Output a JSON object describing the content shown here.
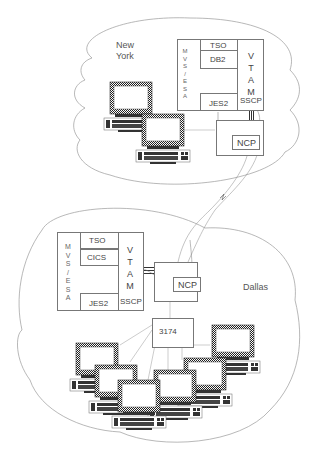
{
  "diagram": {
    "type": "network-topology",
    "sites": [
      {
        "name": "New York",
        "name_lines": [
          "New",
          "York"
        ],
        "host": {
          "os_label_vertical": [
            "M",
            "V",
            "S",
            "/",
            "E",
            "S",
            "A"
          ],
          "subsystems": [
            "TSO",
            "DB2",
            "JES2"
          ],
          "access_method_vertical": [
            "V",
            "T",
            "A",
            "M"
          ],
          "control_point": "SSCP"
        },
        "controller": "NCP",
        "terminals": 2
      },
      {
        "name": "Dallas",
        "host": {
          "os_label_vertical": [
            "M",
            "V",
            "S",
            "/",
            "E",
            "S",
            "A"
          ],
          "subsystems": [
            "TSO",
            "CICS",
            "JES2"
          ],
          "access_method_vertical": [
            "V",
            "T",
            "A",
            "M"
          ],
          "control_point": "SSCP"
        },
        "controller": "NCP",
        "cluster_controller": "3174",
        "terminals": 6
      }
    ],
    "links": [
      {
        "from": "New York NCP",
        "to": "Dallas NCP",
        "type": "remote link"
      },
      {
        "from": "VTAM (New York)",
        "to": "NCP (New York)",
        "type": "channel"
      },
      {
        "from": "VTAM (Dallas)",
        "to": "NCP (Dallas)",
        "type": "channel"
      },
      {
        "from": "NCP (Dallas)",
        "to": "3174",
        "type": "local"
      }
    ]
  },
  "ny": {
    "city_line1": "New",
    "city_line2": "York",
    "mvs": [
      "M",
      "V",
      "S",
      "/",
      "E",
      "S",
      "A"
    ],
    "tso": "TSO",
    "db2": "DB2",
    "jes2": "JES2",
    "vtam": [
      "V",
      "T",
      "A",
      "M"
    ],
    "sscp": "SSCP",
    "ncp": "NCP"
  },
  "dallas": {
    "city": "Dallas",
    "mvs": [
      "M",
      "V",
      "S",
      "/",
      "E",
      "S",
      "A"
    ],
    "tso": "TSO",
    "cics": "CICS",
    "jes2": "JES2",
    "vtam": [
      "V",
      "T",
      "A",
      "M"
    ],
    "sscp": "SSCP",
    "ncp": "NCP",
    "controller": "3174"
  }
}
